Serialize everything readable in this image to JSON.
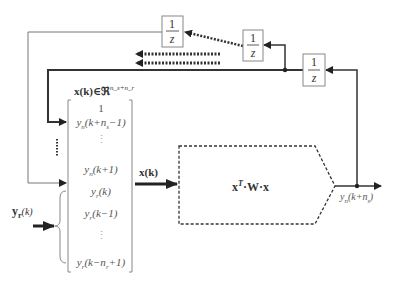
{
  "diagram": {
    "type": "block-diagram",
    "delay_blocks": [
      {
        "id": "delay-1",
        "numerator": "1",
        "denominator": "z"
      },
      {
        "id": "delay-2",
        "numerator": "1",
        "denominator": "z"
      },
      {
        "id": "delay-3",
        "numerator": "1",
        "denominator": "z"
      }
    ],
    "state_label": {
      "main": "x(k)∈ℜ",
      "superscript": "n_s+n_r"
    },
    "state_vector_rows": [
      {
        "text": "1"
      },
      {
        "base": "y",
        "sub": "n",
        "arg": "(k+n",
        "argsub": "s",
        "tail": "−1)"
      },
      {
        "text": "⋮"
      },
      {
        "base": "y",
        "sub": "n",
        "arg": "(k+1)",
        "argsub": "",
        "tail": ""
      },
      {
        "base": "y",
        "sub": "r",
        "arg": "(k)",
        "argsub": "",
        "tail": ""
      },
      {
        "base": "y",
        "sub": "r",
        "arg": "(k−1)",
        "argsub": "",
        "tail": ""
      },
      {
        "text": "⋮"
      },
      {
        "base": "y",
        "sub": "r",
        "arg": "(k−n",
        "argsub": "r",
        "tail": "+1)"
      }
    ],
    "input_label": {
      "base": "y",
      "sub": "r",
      "arg": "(k)"
    },
    "vector_input_label": "x(k)",
    "block_expression": {
      "x": "x",
      "sup": "T",
      "rest": "·W·x"
    },
    "output_label": {
      "base": "y",
      "sub": "n",
      "arg": "(k+n",
      "argsub": "s",
      "tail": ")"
    }
  }
}
